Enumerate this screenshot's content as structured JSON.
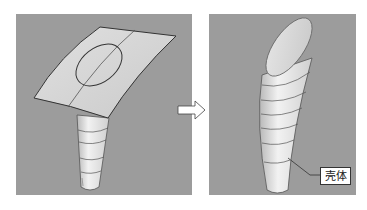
{
  "figure": {
    "left_panel": {
      "description": "surface and tapered tube before trim"
    },
    "right_panel": {
      "description": "resulting solid after trim"
    },
    "arrow": {
      "direction": "right"
    },
    "callout": {
      "label": "壳体"
    },
    "colors": {
      "background": "#9c9c9c",
      "surface": "#d9d9d9",
      "edge": "#444444"
    }
  }
}
